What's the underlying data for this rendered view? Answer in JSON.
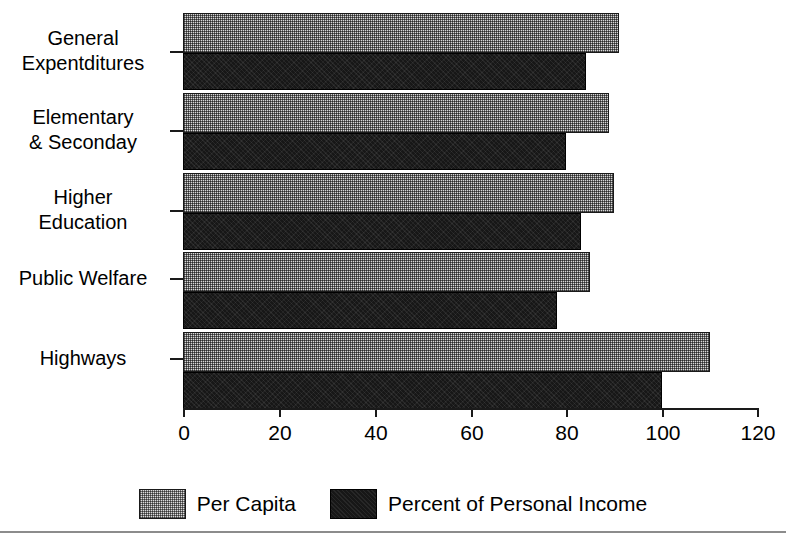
{
  "chart_data": {
    "type": "bar",
    "orientation": "horizontal",
    "title": "",
    "xlabel": "",
    "ylabel": "",
    "xlim": [
      0,
      120
    ],
    "xticks": [
      0,
      20,
      40,
      60,
      80,
      100,
      120
    ],
    "xtick_labels": [
      "0",
      "20",
      "40",
      "60",
      "80",
      "100",
      "120"
    ],
    "grid": false,
    "legend_position": "bottom",
    "categories": [
      "General Expentditures",
      "Elementary & Seconday",
      "Higher Education",
      "Public Welfare",
      "Highways"
    ],
    "category_lines": [
      [
        "General",
        "Expentditures"
      ],
      [
        "Elementary",
        "& Seconday"
      ],
      [
        "Higher",
        "Education"
      ],
      [
        "Public Welfare"
      ],
      [
        "Highways"
      ]
    ],
    "series": [
      {
        "name": "Per Capita",
        "color": "#d8d8d8",
        "pattern": "dotted-gray",
        "values": [
          91,
          89,
          90,
          85,
          110
        ]
      },
      {
        "name": "Percent of Personal Income",
        "color": "#171717",
        "pattern": "solid-black",
        "values": [
          84,
          80,
          83,
          78,
          100
        ]
      }
    ]
  },
  "legend": {
    "items": [
      {
        "label": "Per Capita",
        "swatch": "capita"
      },
      {
        "label": "Percent of Personal Income",
        "swatch": "income"
      }
    ]
  }
}
